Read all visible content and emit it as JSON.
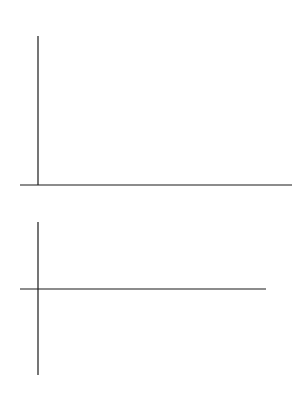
{
  "chart_data": [
    {
      "type": "line",
      "title": "",
      "xlabel": "t",
      "ylabel": "q",
      "xlim": [
        80,
        121
      ],
      "ylim": [
        0.76,
        1.55
      ],
      "xticks": [
        90,
        100,
        110,
        120
      ],
      "yticks": [
        0.8,
        1.0,
        1.2,
        1.4
      ],
      "ytick_labels": [
        "0.8",
        "1.0",
        "1.2",
        "1.4"
      ],
      "grid": false,
      "legend": null,
      "series": [
        {
          "name": "q(t)",
          "color": "#1a1a1a",
          "x": [
            81.0,
            81.4,
            82.0,
            83.0,
            84.0,
            85.0,
            86.0,
            87.0,
            87.8,
            88.5,
            89.5,
            90.5,
            91.5,
            92.5,
            93.0,
            94.0,
            95.0,
            96.0,
            97.0,
            98.0,
            99.0,
            100.0,
            101.0,
            102.0,
            103.0,
            104.5,
            105.0,
            106.0,
            107.0,
            108.0,
            109.0,
            110.0,
            111.0,
            112.0,
            113.0,
            114.0,
            115.0,
            116.3,
            117.0,
            118.0,
            119.0,
            120.0
          ],
          "y": [
            1.44,
            1.49,
            1.45,
            1.28,
            1.16,
            1.08,
            0.95,
            0.85,
            0.78,
            0.87,
            1.05,
            1.22,
            1.37,
            1.49,
            1.45,
            1.32,
            1.19,
            1.1,
            0.97,
            0.88,
            0.82,
            0.78,
            0.9,
            1.08,
            1.27,
            1.49,
            1.45,
            1.31,
            1.19,
            1.09,
            0.97,
            0.89,
            0.82,
            0.78,
            0.92,
            1.1,
            1.28,
            1.49,
            1.42,
            1.3,
            1.19,
            1.12
          ]
        }
      ]
    },
    {
      "type": "scatter",
      "title": "",
      "xlabel": "t",
      "ylabel": "n",
      "xlim": [
        80,
        121
      ],
      "ylim": [
        -0.27,
        0.26
      ],
      "xticks": [
        90,
        100,
        110,
        120
      ],
      "yticks": [
        0.2,
        0.1,
        -0.1,
        -0.2,
        -0.23
      ],
      "ytick_labels": [
        "0.20",
        "0.10",
        "-0.10",
        "-0.20",
        "-0.23"
      ],
      "grid": false,
      "legend": null,
      "baseline": {
        "y": 0.2,
        "x_range": [
          81,
          121
        ]
      },
      "descending_streaks": [
        {
          "x_top": 81.3,
          "y_top": 0.19,
          "x_bottom": 81.5,
          "y_bottom": 0.16
        },
        {
          "x_top": 85.5,
          "y_top": 0.19,
          "x_bottom": 84.0,
          "y_bottom": 0.04
        },
        {
          "x_top": 86.8,
          "y_top": 0.19,
          "x_bottom": 85.8,
          "y_bottom": 0.08
        },
        {
          "x_top": 88.0,
          "y_top": 0.2,
          "x_bottom": 87.5,
          "y_bottom": 0.1
        },
        {
          "x_top": 89.3,
          "y_top": 0.19,
          "x_bottom": 88.6,
          "y_bottom": -0.04
        },
        {
          "x_top": 90.5,
          "y_top": 0.19,
          "x_bottom": 89.6,
          "y_bottom": -0.04
        },
        {
          "x_top": 92.5,
          "y_top": 0.2,
          "x_bottom": 92.4,
          "y_bottom": 0.16
        },
        {
          "x_top": 97.5,
          "y_top": 0.19,
          "x_bottom": 96.2,
          "y_bottom": 0.04
        },
        {
          "x_top": 98.7,
          "y_top": 0.19,
          "x_bottom": 98.0,
          "y_bottom": 0.1
        },
        {
          "x_top": 100.5,
          "y_top": 0.19,
          "x_bottom": 99.5,
          "y_bottom": -0.02
        },
        {
          "x_top": 101.8,
          "y_top": 0.19,
          "x_bottom": 100.8,
          "y_bottom": -0.02
        },
        {
          "x_top": 103.8,
          "y_top": 0.2,
          "x_bottom": 103.7,
          "y_bottom": 0.14
        },
        {
          "x_top": 109.8,
          "y_top": 0.19,
          "x_bottom": 108.3,
          "y_bottom": 0.04
        },
        {
          "x_top": 111.0,
          "y_top": 0.19,
          "x_bottom": 110.3,
          "y_bottom": 0.11
        },
        {
          "x_top": 112.5,
          "y_top": 0.19,
          "x_bottom": 111.7,
          "y_bottom": -0.02
        },
        {
          "x_top": 114.0,
          "y_top": 0.19,
          "x_bottom": 113.2,
          "y_bottom": -0.02
        },
        {
          "x_top": 115.6,
          "y_top": 0.2,
          "x_bottom": 115.5,
          "y_bottom": 0.13
        }
      ],
      "scattered_points": [
        {
          "x": 81.2,
          "y": 0.04
        },
        {
          "x": 81.5,
          "y": -0.1
        },
        {
          "x": 87.8,
          "y": -0.1
        },
        {
          "x": 87.8,
          "y": -0.22
        },
        {
          "x": 87.8,
          "y": -0.26
        },
        {
          "x": 87.9,
          "y": 0.07
        },
        {
          "x": 89.0,
          "y": -0.06
        },
        {
          "x": 92.4,
          "y": 0.05
        },
        {
          "x": 92.5,
          "y": -0.08
        },
        {
          "x": 92.6,
          "y": -0.33
        },
        {
          "x": 97.0,
          "y": 0.11
        },
        {
          "x": 98.0,
          "y": 0.02
        },
        {
          "x": 99.6,
          "y": 0.04
        },
        {
          "x": 99.6,
          "y": -0.11
        },
        {
          "x": 99.7,
          "y": -0.22
        },
        {
          "x": 99.8,
          "y": -0.25
        },
        {
          "x": 100.5,
          "y": -0.06
        },
        {
          "x": 103.5,
          "y": 0.07
        },
        {
          "x": 104.0,
          "y": -0.05
        },
        {
          "x": 104.6,
          "y": -0.23
        },
        {
          "x": 111.7,
          "y": 0.06
        },
        {
          "x": 111.6,
          "y": -0.07
        },
        {
          "x": 111.8,
          "y": -0.2
        },
        {
          "x": 113.3,
          "y": -0.04
        },
        {
          "x": 113.2,
          "y": 0.02
        },
        {
          "x": 115.6,
          "y": 0.07
        },
        {
          "x": 115.5,
          "y": -0.01
        },
        {
          "x": 115.6,
          "y": -0.19
        }
      ]
    }
  ],
  "figure": {
    "top": {
      "x_axis_label": "t",
      "y_axis_label": "q"
    },
    "bottom": {
      "x_axis_label": "t",
      "y_axis_label": "n"
    }
  }
}
